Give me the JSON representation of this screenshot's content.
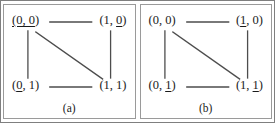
{
  "figure": {
    "type": "diagram",
    "stroke_color": "#4d4d4d",
    "border_color": "#7f7f7f",
    "text_color": "#1a1a1a",
    "background": "#ffffff"
  },
  "panels": [
    {
      "caption": "(a)",
      "vertices": {
        "top_left": {
          "open": "(",
          "x": "0",
          "sep": ", ",
          "y": "0",
          "close": ")",
          "underline": "both"
        },
        "top_right": {
          "open": "(",
          "x": "1",
          "sep": ", ",
          "y": "0",
          "close": ")",
          "underline": "second"
        },
        "bottom_left": {
          "open": "(",
          "x": "0",
          "sep": ", ",
          "y": "1",
          "close": ")",
          "underline": "first"
        },
        "bottom_right": {
          "open": "(",
          "x": "1",
          "sep": ", ",
          "y": "1",
          "close": ")",
          "underline": "none"
        }
      },
      "edges": [
        "top",
        "left",
        "right",
        "bottom",
        "diagonal-tl-br"
      ]
    },
    {
      "caption": "(b)",
      "vertices": {
        "top_left": {
          "open": "(",
          "x": "0",
          "sep": ", ",
          "y": "0",
          "close": ")",
          "underline": "none"
        },
        "top_right": {
          "open": "(",
          "x": "1",
          "sep": ", ",
          "y": "0",
          "close": ")",
          "underline": "first"
        },
        "bottom_left": {
          "open": "(",
          "x": "0",
          "sep": ", ",
          "y": "1",
          "close": ")",
          "underline": "second"
        },
        "bottom_right": {
          "open": "(",
          "x": "1",
          "sep": ", ",
          "y": "1",
          "close": ")",
          "underline": "second"
        }
      },
      "edges": [
        "top",
        "left",
        "right",
        "bottom",
        "diagonal-tl-br"
      ]
    }
  ]
}
